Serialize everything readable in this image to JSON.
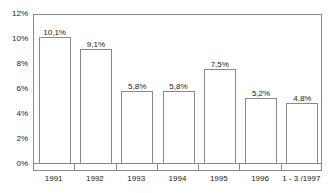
{
  "chart_data": {
    "type": "bar",
    "title": "",
    "xlabel": "",
    "ylabel": "",
    "categories": [
      "1991",
      "1992",
      "1993",
      "1994",
      "1995",
      "1996",
      "1 - 3 /1997"
    ],
    "values": [
      10.1,
      9.1,
      5.8,
      5.8,
      7.5,
      5.2,
      4.8
    ],
    "value_labels": [
      "10,1%",
      "9,1%",
      "5,8%",
      "5,8%",
      "7,5%",
      "5,2%",
      "4,8%"
    ],
    "ylim": [
      0,
      12
    ],
    "ytick_values": [
      0,
      2,
      4,
      6,
      8,
      10,
      12
    ],
    "ytick_labels": [
      "0%",
      "2%",
      "4%",
      "6%",
      "8%",
      "10%",
      "12%"
    ],
    "grid": false,
    "legend": null,
    "bar_fill_color": "#ffffff",
    "bar_border_color": "#8a8a8a",
    "frame_color": "#8a8a8a",
    "text_color": "#1a1a1a",
    "background_color": "#ffffff"
  }
}
